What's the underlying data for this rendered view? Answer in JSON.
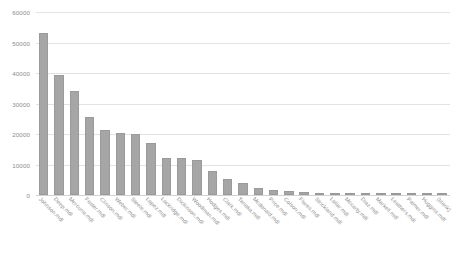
{
  "chart_data": {
    "type": "bar",
    "title": "",
    "xlabel": "",
    "ylabel": "",
    "ylim": [
      0,
      60000
    ],
    "yticks": [
      0,
      10000,
      20000,
      30000,
      40000,
      50000,
      60000
    ],
    "ytick_labels": [
      "0",
      "10000",
      "20000",
      "30000",
      "40000",
      "50000",
      "60000"
    ],
    "grid": true,
    "legend": false,
    "bar_color": "#a6a6a6",
    "grid_color": "#e2e2e4",
    "categories": [
      "Johnson.mdl",
      "Deep.mdl",
      "Mercurio.mdl",
      "Foster.mdl",
      "Clinson.mdl",
      "Weber.mdl",
      "Steele.mdl",
      "Lopez.mdl",
      "Lockridge.mdl",
      "Dickinson.mdl",
      "Woodman.mdl",
      "Hodges.mdl",
      "Clark.mdl",
      "Tanaka.mdl",
      "Mcdonald.mdl",
      "Price.mdl",
      "Colson.mdl",
      "Flores.mdl",
      "Strickland.mdl",
      "Lollar.mdl",
      "Mccarty.mdl",
      "Diaz.mdl",
      "Markell.mdl",
      "Leathers.mdl",
      "Palmer.mdl",
      "Huggins.mdl",
      "(blank)"
    ],
    "values": [
      53000,
      39200,
      34200,
      25600,
      21300,
      20400,
      20000,
      17000,
      12200,
      12100,
      11500,
      8000,
      5400,
      4000,
      2400,
      1500,
      1200,
      900,
      700,
      600,
      450,
      350,
      280,
      220,
      170,
      120,
      80
    ]
  }
}
